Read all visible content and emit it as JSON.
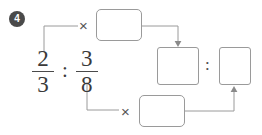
{
  "problem": {
    "number": "4",
    "type": "ratio-simplification-diagram"
  },
  "expression": {
    "left_fraction": {
      "numerator": "2",
      "denominator": "3"
    },
    "ratio_symbol": ":",
    "right_fraction": {
      "numerator": "3",
      "denominator": "8"
    }
  },
  "operators": {
    "times_top": "×",
    "times_bottom": "×",
    "result_ratio_symbol": ":"
  },
  "boxes": {
    "top": {
      "value": "",
      "placeholder": ""
    },
    "bottom": {
      "value": "",
      "placeholder": ""
    },
    "result_left": {
      "value": "",
      "placeholder": ""
    },
    "result_right": {
      "value": "",
      "placeholder": ""
    }
  },
  "colors": {
    "ink": "#3a3a3a",
    "line": "#9a9a9a",
    "badge_bg": "#4a4a4a",
    "badge_text": "#ffffff",
    "page_bg": "#ffffff"
  }
}
